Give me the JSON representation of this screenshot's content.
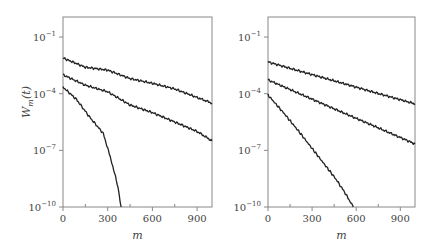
{
  "chart_data": [
    {
      "type": "line",
      "panel": "left",
      "title": "",
      "xlabel": "m",
      "ylabel": "W_m(t)",
      "xlim": [
        0,
        1000
      ],
      "ylim": [
        1e-10,
        1.15
      ],
      "yscale": "log",
      "grid": false,
      "legend": null,
      "xticks": [
        0,
        300,
        600,
        900
      ],
      "xtick_labels": [
        "0",
        "300",
        "600",
        "900"
      ],
      "xminor_ticks": [
        150,
        450,
        750
      ],
      "yticks": [
        -1,
        -4,
        -7,
        -10
      ],
      "ytick_labels": [
        "10",
        "10",
        "10",
        "10"
      ],
      "ytick_exponents": [
        "−1",
        "−4",
        "−7",
        "−10"
      ],
      "series": [
        {
          "name": "curve-1",
          "m": [
            0,
            150,
            300,
            450,
            600,
            750,
            900,
            1000
          ],
          "log10_values": [
            -2.11,
            -2.6,
            -2.75,
            -3.2,
            -3.45,
            -3.75,
            -4.2,
            -4.5
          ]
        },
        {
          "name": "curve-2",
          "m": [
            0,
            150,
            300,
            450,
            600,
            750,
            900,
            1000
          ],
          "log10_values": [
            -3.0,
            -3.55,
            -3.9,
            -4.6,
            -5.0,
            -5.5,
            -6.0,
            -6.5
          ]
        },
        {
          "name": "curve-3",
          "m": [
            0,
            90,
            180,
            270,
            300,
            340,
            370,
            390
          ],
          "log10_values": [
            -3.65,
            -4.3,
            -5.25,
            -6.1,
            -6.9,
            -8.0,
            -9.0,
            -10.0
          ]
        }
      ]
    },
    {
      "type": "line",
      "panel": "right",
      "title": "",
      "xlabel": "m",
      "ylabel": "",
      "xlim": [
        0,
        1000
      ],
      "ylim": [
        1e-10,
        1.15
      ],
      "yscale": "log",
      "grid": false,
      "legend": null,
      "xticks": [
        0,
        300,
        600,
        900
      ],
      "xtick_labels": [
        "0",
        "300",
        "600",
        "900"
      ],
      "xminor_ticks": [
        150,
        450,
        750
      ],
      "yticks": [
        -1,
        -4,
        -7,
        -10
      ],
      "ytick_labels": [
        "10",
        "10",
        "10",
        "10"
      ],
      "ytick_exponents": [
        "−1",
        "−4",
        "−7",
        "−10"
      ],
      "series": [
        {
          "name": "curve-1",
          "m": [
            0,
            250,
            500,
            750,
            1000
          ],
          "log10_values": [
            -2.32,
            -2.88,
            -3.43,
            -3.99,
            -4.54
          ]
        },
        {
          "name": "curve-2",
          "m": [
            0,
            250,
            500,
            750,
            1000
          ],
          "log10_values": [
            -3.27,
            -4.12,
            -4.97,
            -5.81,
            -6.66
          ]
        },
        {
          "name": "curve-3",
          "m": [
            0,
            110,
            220,
            300,
            380,
            460,
            520,
            580
          ],
          "log10_values": [
            -4.07,
            -5.05,
            -6.1,
            -6.9,
            -7.7,
            -8.5,
            -9.2,
            -10.0
          ]
        }
      ]
    }
  ],
  "style": {
    "line_color": "#222222",
    "frame_color": "#888888",
    "text_color": "#444444"
  }
}
